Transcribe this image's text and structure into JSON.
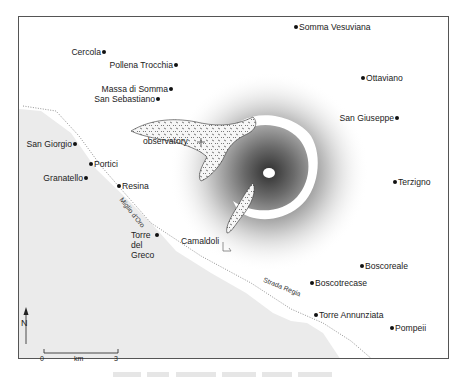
{
  "map": {
    "colors": {
      "land": "#ffffff",
      "sea": "#ebebeb",
      "frame": "#555555",
      "lava": "#f4f4f4",
      "crater_shadow": "#3a3a3a"
    },
    "places": [
      {
        "name": "Somma Vesuviana",
        "x": 296,
        "y": 27,
        "dot": "left"
      },
      {
        "name": "Cercola",
        "x": 104,
        "y": 52,
        "dot": "right"
      },
      {
        "name": "Pollena Trocchia",
        "x": 176,
        "y": 65,
        "dot": "right"
      },
      {
        "name": "Ottaviano",
        "x": 363,
        "y": 78,
        "dot": "left"
      },
      {
        "name": "Massa di Somma",
        "x": 171,
        "y": 89,
        "dot": "right"
      },
      {
        "name": "San Sebastiano",
        "x": 158,
        "y": 99,
        "dot": "right"
      },
      {
        "name": "San Giuseppe",
        "x": 397,
        "y": 118,
        "dot": "right"
      },
      {
        "name": "San Giorgio",
        "x": 75,
        "y": 144,
        "dot": "right"
      },
      {
        "name": "Portici",
        "x": 91,
        "y": 164,
        "dot": "left"
      },
      {
        "name": "Granatello",
        "x": 86,
        "y": 178,
        "dot": "right"
      },
      {
        "name": "Resina",
        "x": 119,
        "y": 186,
        "dot": "left"
      },
      {
        "name": "Terzigno",
        "x": 395,
        "y": 182,
        "dot": "left"
      },
      {
        "name": "Boscoreale",
        "x": 362,
        "y": 266,
        "dot": "left"
      },
      {
        "name": "Boscotrecase",
        "x": 312,
        "y": 283,
        "dot": "left"
      },
      {
        "name": "Torre Annunziata",
        "x": 316,
        "y": 315,
        "dot": "left"
      },
      {
        "name": "Pompeii",
        "x": 392,
        "y": 328,
        "dot": "left"
      }
    ],
    "torre_del_greco": {
      "lines": [
        "Torre",
        "del",
        "Greco"
      ],
      "x": 157,
      "y": 235
    },
    "observatory": {
      "label": "observatory",
      "x": 196,
      "y": 141
    },
    "camaldoli": {
      "label": "Camaldoli",
      "x": 181,
      "y": 241
    },
    "roads": [
      {
        "label": "Miglio d'Oro",
        "x": 125,
        "y": 196,
        "angle": 52
      },
      {
        "label": "Strada Regia",
        "x": 266,
        "y": 280,
        "angle": 22
      }
    ],
    "north_label": "N",
    "scale": {
      "start": "0",
      "unit": "km",
      "end": "3"
    },
    "caption": "Vesuvius and surrounding towns"
  }
}
